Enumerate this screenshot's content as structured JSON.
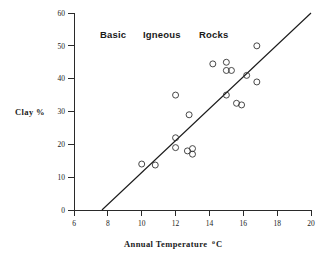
{
  "chart_data": {
    "type": "scatter",
    "title": "Basic  Igneous  Rocks",
    "title_words": [
      "Basic",
      "Igneous",
      "Rocks"
    ],
    "xlabel": "Annual Temperature ºC",
    "xlabel_main": "Annual Temperature",
    "xlabel_sup": "o",
    "xlabel_unit": "C",
    "ylabel": "Clay %",
    "xlim": [
      6,
      20
    ],
    "ylim": [
      0,
      60
    ],
    "xticks": [
      6,
      8,
      10,
      12,
      14,
      16,
      18,
      20
    ],
    "xtick_labels": [
      "6",
      "8",
      "10",
      "12",
      "14",
      "16",
      "18",
      "20"
    ],
    "yticks": [
      0,
      10,
      20,
      30,
      40,
      50,
      60
    ],
    "ytick_labels": [
      "0",
      "10",
      "20",
      "30",
      "40",
      "50",
      "60"
    ],
    "grid": false,
    "legend": false,
    "marker": "open-circle",
    "marker_color": "#333333",
    "line_color": "#1a1a1a",
    "points": [
      {
        "x": 10.0,
        "y": 14.0
      },
      {
        "x": 10.8,
        "y": 13.7
      },
      {
        "x": 12.0,
        "y": 35.0
      },
      {
        "x": 12.0,
        "y": 22.0
      },
      {
        "x": 12.0,
        "y": 19.0
      },
      {
        "x": 12.7,
        "y": 18.0
      },
      {
        "x": 12.8,
        "y": 29.0
      },
      {
        "x": 13.0,
        "y": 18.7
      },
      {
        "x": 13.0,
        "y": 17.0
      },
      {
        "x": 14.2,
        "y": 44.5
      },
      {
        "x": 15.0,
        "y": 45.0
      },
      {
        "x": 15.0,
        "y": 42.5
      },
      {
        "x": 15.3,
        "y": 42.5
      },
      {
        "x": 15.0,
        "y": 35.0
      },
      {
        "x": 15.6,
        "y": 32.5
      },
      {
        "x": 15.9,
        "y": 32.0
      },
      {
        "x": 16.2,
        "y": 41.0
      },
      {
        "x": 16.8,
        "y": 50.0
      },
      {
        "x": 16.8,
        "y": 39.0
      }
    ],
    "trend_line": {
      "x1": 7.65,
      "y1": 0,
      "x2": 20.0,
      "y2": 60.0
    }
  }
}
